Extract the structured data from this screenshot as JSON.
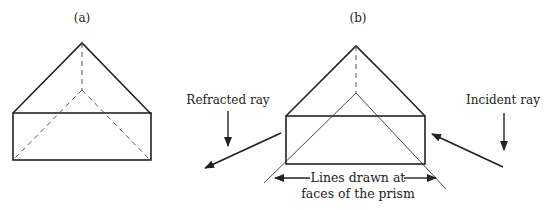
{
  "figure": {
    "panels": [
      {
        "id": "a",
        "label": "(a)"
      },
      {
        "id": "b",
        "label": "(b)"
      }
    ],
    "annotations": {
      "refracted_ray": "Refracted ray",
      "incident_ray": "Incident ray",
      "faces_line1": "Lines drawn at",
      "faces_line2": "faces of the prism"
    },
    "colors": {
      "stroke": "#222222",
      "hidden_edge": "#555555"
    }
  }
}
